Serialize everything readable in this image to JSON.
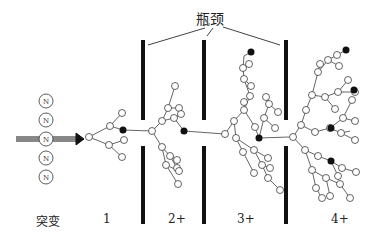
{
  "title": "瓶颈",
  "labels": {
    "mutation": "突变",
    "stage1": "1",
    "stage2": "2+",
    "stage3": "3+",
    "stage4": "4+"
  },
  "nucleotide_label": "N",
  "nucleotide_count": 5,
  "colors": {
    "ink": "#111111",
    "node_fill": "#ffffff",
    "mutant_fill": "#111111"
  }
}
